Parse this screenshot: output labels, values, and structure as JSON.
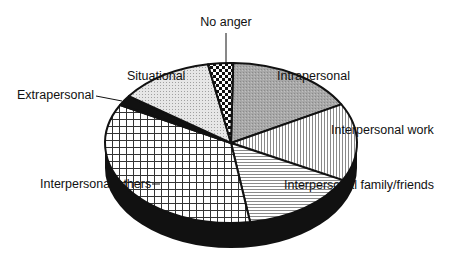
{
  "chart_data": {
    "type": "pie",
    "style": "3d-tilted",
    "title": "",
    "slices": [
      {
        "label": "Intrapersonal",
        "value": 16.7,
        "pattern": "gray-stipple"
      },
      {
        "label": "Interpersonal work",
        "value": 15.7,
        "pattern": "vertical-lines"
      },
      {
        "label": "Interpersonal family/friends",
        "value": 14.9,
        "pattern": "horizontal-lines"
      },
      {
        "label": "Interpersonal others",
        "value": 35.3,
        "pattern": "grid"
      },
      {
        "label": "Extrapersonal",
        "value": 2.1,
        "pattern": "solid-black"
      },
      {
        "label": "Situational",
        "value": 12.1,
        "pattern": "light-stipple"
      },
      {
        "label": "No anger",
        "value": 3.2,
        "pattern": "checkerboard"
      }
    ],
    "start_angle_deg_clockwise_from_top": 1,
    "direction": "clockwise",
    "unit": "percent (estimated)"
  }
}
